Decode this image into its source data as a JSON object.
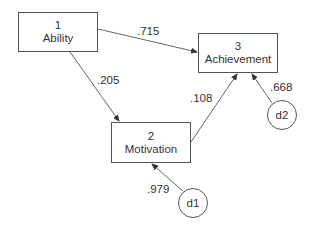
{
  "diagram": {
    "type": "path-model",
    "nodes": [
      {
        "id": "1",
        "number": "1",
        "label": "Ability"
      },
      {
        "id": "2",
        "number": "2",
        "label": "Motivation"
      },
      {
        "id": "3",
        "number": "3",
        "label": "Achievement"
      }
    ],
    "disturbances": [
      {
        "id": "d1",
        "label": "d1",
        "target": "2"
      },
      {
        "id": "d2",
        "label": "d2",
        "target": "3"
      }
    ],
    "paths": [
      {
        "from": "1",
        "to": "3",
        "coef": ".715"
      },
      {
        "from": "1",
        "to": "2",
        "coef": ".205"
      },
      {
        "from": "2",
        "to": "3",
        "coef": ".108"
      },
      {
        "from": "d1",
        "to": "2",
        "coef": ".979"
      },
      {
        "from": "d2",
        "to": "3",
        "coef": ".668"
      }
    ]
  }
}
